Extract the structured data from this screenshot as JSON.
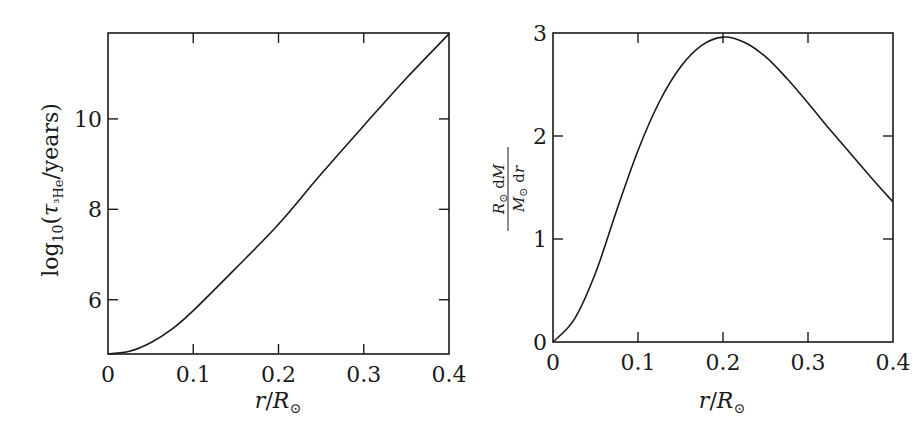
{
  "chart_data": [
    {
      "type": "line",
      "title": "",
      "xlabel": "r/R⊙",
      "ylabel": "log10(τ3He/years)",
      "xlim": [
        0,
        0.4
      ],
      "ylim": [
        4.8,
        11.9
      ],
      "xticks": [
        "0",
        "0.1",
        "0.2",
        "0.3",
        "0.4"
      ],
      "yticks": [
        "6",
        "8",
        "10"
      ],
      "grid": false,
      "legend": null,
      "series": [
        {
          "name": "log10 tau_3He",
          "x": [
            0.0,
            0.025,
            0.05,
            0.075,
            0.1,
            0.15,
            0.2,
            0.25,
            0.3,
            0.35,
            0.4
          ],
          "y": [
            4.8,
            4.86,
            5.05,
            5.35,
            5.76,
            6.7,
            7.67,
            8.78,
            9.85,
            10.9,
            11.88
          ]
        }
      ]
    },
    {
      "type": "line",
      "title": "",
      "xlabel": "r/R⊙",
      "ylabel": "(R⊙/M⊙) dM/dr",
      "xlim": [
        0,
        0.4
      ],
      "ylim": [
        0,
        3
      ],
      "xticks": [
        "0",
        "0.1",
        "0.2",
        "0.3",
        "0.4"
      ],
      "yticks": [
        "0",
        "1",
        "2",
        "3"
      ],
      "grid": false,
      "legend": null,
      "series": [
        {
          "name": "dM/dr",
          "x": [
            0.0,
            0.025,
            0.05,
            0.075,
            0.1,
            0.125,
            0.15,
            0.175,
            0.2,
            0.225,
            0.25,
            0.275,
            0.3,
            0.325,
            0.35,
            0.375,
            0.4
          ],
          "y": [
            0.0,
            0.22,
            0.67,
            1.28,
            1.86,
            2.33,
            2.67,
            2.88,
            2.96,
            2.91,
            2.77,
            2.56,
            2.32,
            2.07,
            1.83,
            1.59,
            1.36
          ]
        }
      ]
    }
  ],
  "left_panel": {
    "ylabel_text": "log₁₀(τ³He/years)",
    "xlabel_text": "r/R⊙"
  },
  "right_panel": {
    "ylabel_num": "R⊙ dM",
    "ylabel_den": "M⊙ dr",
    "xlabel_text": "r/R⊙"
  }
}
